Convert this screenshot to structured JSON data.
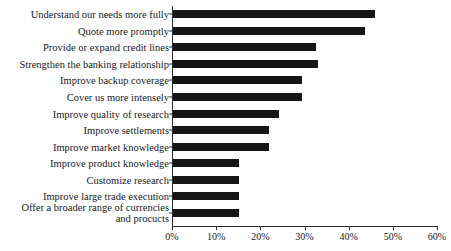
{
  "chart_data": {
    "type": "bar",
    "orientation": "horizontal",
    "title": "",
    "subtitle": "",
    "xlabel": "",
    "ylabel": "",
    "xlim": [
      0,
      60
    ],
    "grid": false,
    "legend": null,
    "bar_color": "#161616",
    "axis_color": "#2b2b2b",
    "xticks": [
      "0%",
      "10%",
      "20%",
      "30%",
      "40%",
      "50%",
      "60%"
    ],
    "xtick_values": [
      0,
      10,
      20,
      30,
      40,
      50,
      60
    ],
    "categories": [
      "Understand our needs more fully",
      "Quote more promptly",
      "Provide or expand credit lines",
      "Strengthen the banking relationship",
      "Improve backup coverage",
      "Cover us more intensely",
      "Improve quality of research",
      "Improve settlements",
      "Improve market knowledge",
      "Improve product knowledge",
      "Customize research",
      "Improve large trade execution",
      "Offer a broader range of currencies and procucts"
    ],
    "values": [
      45.7,
      43.5,
      32.4,
      32.8,
      29.2,
      29.2,
      24.0,
      21.7,
      21.7,
      15.0,
      15.0,
      15.0,
      15.0
    ]
  },
  "labels": {
    "0": "Understand our needs more fully",
    "1": "Quote more promptly",
    "2": "Provide or expand credit lines",
    "3": "Strengthen the banking relationship",
    "4": "Improve backup coverage",
    "5": "Cover us more intensely",
    "6": "Improve quality of research",
    "7": "Improve settlements",
    "8": "Improve market knowledge",
    "9": "Improve product knowledge",
    "10": "Customize research",
    "11": "Improve large trade execution",
    "12": "Offer a broader range of",
    "13": "currencies and procucts"
  }
}
